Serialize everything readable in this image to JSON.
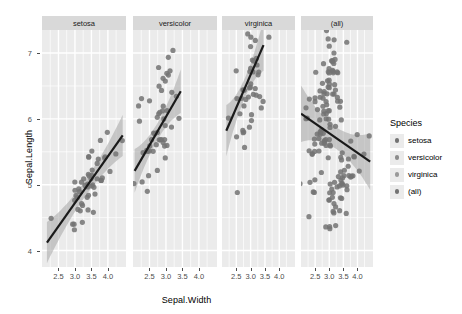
{
  "chart_data": {
    "type": "scatter",
    "title": "",
    "xlabel": "Sepal.Width",
    "ylabel": "Sepal.Length",
    "xlim": [
      2.0,
      4.55
    ],
    "ylim": [
      3.75,
      7.35
    ],
    "xticks": [
      2.5,
      3.0,
      3.5,
      4.0
    ],
    "xtick_labels": [
      "2.5",
      "3.0",
      "3.5",
      "4.0"
    ],
    "yticks": [
      4,
      5,
      6,
      7
    ],
    "ytick_labels": [
      "4",
      "5",
      "6",
      "7"
    ],
    "grid": true,
    "legend_position": "right",
    "legend_title": "Species",
    "facet_labels": [
      "setosa",
      "versicolor",
      "virginica",
      "(all)"
    ],
    "point_color": "#737373",
    "line_color": "#1a1a1a",
    "band_color": "#a6a6a6",
    "panel_background": "#ebebeb",
    "strip_background": "#d9d9d9",
    "grid_color": "#ffffff",
    "series": [
      {
        "name": "setosa",
        "facet": "setosa",
        "fit": {
          "x0": 2.15,
          "y0": 4.12,
          "x1": 4.45,
          "y1": 5.75,
          "se": 0.16
        },
        "x": [
          3.5,
          3.0,
          3.2,
          3.1,
          3.6,
          3.9,
          3.4,
          3.4,
          2.9,
          3.1,
          3.7,
          3.4,
          3.0,
          3.0,
          4.0,
          4.4,
          3.9,
          3.5,
          3.8,
          3.8,
          3.4,
          3.7,
          3.6,
          3.3,
          3.4,
          3.0,
          3.4,
          3.5,
          3.4,
          3.2,
          3.1,
          3.4,
          4.1,
          4.2,
          3.1,
          3.2,
          3.5,
          3.6,
          3.0,
          3.4,
          3.5,
          2.3,
          3.2,
          3.5,
          3.8,
          3.0,
          3.8,
          3.2,
          3.7,
          3.3
        ],
        "y": [
          5.1,
          4.9,
          4.7,
          4.6,
          5.0,
          5.4,
          4.6,
          5.0,
          4.4,
          4.9,
          5.4,
          4.8,
          4.8,
          4.3,
          5.8,
          5.7,
          5.4,
          5.1,
          5.7,
          5.1,
          5.4,
          5.1,
          4.6,
          5.1,
          4.8,
          5.0,
          5.0,
          5.2,
          5.2,
          4.7,
          4.8,
          5.4,
          5.2,
          5.5,
          4.9,
          5.0,
          5.5,
          4.9,
          4.4,
          5.1,
          5.0,
          4.5,
          4.4,
          5.0,
          5.1,
          4.8,
          5.1,
          4.6,
          5.3,
          5.0
        ]
      },
      {
        "name": "versicolor",
        "facet": "versicolor",
        "fit": {
          "x0": 2.05,
          "y0": 5.21,
          "x1": 3.45,
          "y1": 6.42,
          "se": 0.17
        },
        "x": [
          3.2,
          3.2,
          3.1,
          2.3,
          2.8,
          2.8,
          3.3,
          2.4,
          2.9,
          2.7,
          2.0,
          3.0,
          2.2,
          2.9,
          2.9,
          3.1,
          3.0,
          2.7,
          2.2,
          2.5,
          3.2,
          2.8,
          2.5,
          2.8,
          2.9,
          3.0,
          2.8,
          3.0,
          2.9,
          2.6,
          2.4,
          2.4,
          2.7,
          2.7,
          3.0,
          3.4,
          3.1,
          2.3,
          3.0,
          2.5,
          2.6,
          3.0,
          2.6,
          2.3,
          2.7,
          3.0,
          2.9,
          2.9,
          2.5,
          2.8
        ],
        "y": [
          7.0,
          6.4,
          6.9,
          5.5,
          6.5,
          5.7,
          6.3,
          4.9,
          6.6,
          5.2,
          5.0,
          5.9,
          6.0,
          6.1,
          5.6,
          6.7,
          5.6,
          5.8,
          6.2,
          5.6,
          5.9,
          6.1,
          6.3,
          6.1,
          6.4,
          6.6,
          6.8,
          6.7,
          6.0,
          5.7,
          5.5,
          5.5,
          5.8,
          6.0,
          5.4,
          6.0,
          6.7,
          6.3,
          5.6,
          5.5,
          5.5,
          6.1,
          5.8,
          5.0,
          5.6,
          5.7,
          5.7,
          6.2,
          5.1,
          5.7
        ]
      },
      {
        "name": "virginica",
        "facet": "virginica",
        "fit": {
          "x0": 2.15,
          "y0": 5.82,
          "x1": 3.45,
          "y1": 7.12,
          "se": 0.2
        },
        "x": [
          3.3,
          2.7,
          3.0,
          2.9,
          3.0,
          3.0,
          2.5,
          2.9,
          2.5,
          3.6,
          3.2,
          2.7,
          3.0,
          2.5,
          2.8,
          3.2,
          3.0,
          3.8,
          2.6,
          2.2,
          3.2,
          2.8,
          2.8,
          2.7,
          3.3,
          3.2,
          2.8,
          3.0,
          2.8,
          3.0,
          2.8,
          3.8,
          2.8,
          2.8,
          2.6,
          3.0,
          3.4,
          3.1,
          3.0,
          3.1,
          3.1,
          3.1,
          2.7,
          3.2,
          3.3,
          3.0,
          2.5,
          3.0,
          3.4,
          3.0
        ],
        "y": [
          6.3,
          5.8,
          7.1,
          6.3,
          6.5,
          7.6,
          4.9,
          7.3,
          6.7,
          7.2,
          6.5,
          6.4,
          6.8,
          5.7,
          5.8,
          6.4,
          6.5,
          7.7,
          7.7,
          6.0,
          6.9,
          5.6,
          7.7,
          6.3,
          6.7,
          7.2,
          6.2,
          6.1,
          6.4,
          7.2,
          7.4,
          7.9,
          6.4,
          6.3,
          6.1,
          7.7,
          6.3,
          6.4,
          6.0,
          6.9,
          6.7,
          6.9,
          5.8,
          6.8,
          6.7,
          6.7,
          6.3,
          6.5,
          6.2,
          5.9
        ]
      },
      {
        "name": "(all)",
        "facet": "(all)",
        "fit": {
          "x0": 2.0,
          "y0": 6.08,
          "x1": 4.45,
          "y1": 5.35,
          "se": 0.22
        },
        "x": [
          3.5,
          3.0,
          3.2,
          3.1,
          3.6,
          3.9,
          3.4,
          3.4,
          2.9,
          3.1,
          3.7,
          3.4,
          3.0,
          3.0,
          4.0,
          4.4,
          3.9,
          3.5,
          3.8,
          3.8,
          3.4,
          3.7,
          3.6,
          3.3,
          3.4,
          3.0,
          3.4,
          3.5,
          3.4,
          3.2,
          3.1,
          3.4,
          4.1,
          4.2,
          3.1,
          3.2,
          3.5,
          3.6,
          3.0,
          3.4,
          3.5,
          2.3,
          3.2,
          3.5,
          3.8,
          3.0,
          3.8,
          3.2,
          3.7,
          3.3,
          3.2,
          3.2,
          3.1,
          2.3,
          2.8,
          2.8,
          3.3,
          2.4,
          2.9,
          2.7,
          2.0,
          3.0,
          2.2,
          2.9,
          2.9,
          3.1,
          3.0,
          2.7,
          2.2,
          2.5,
          3.2,
          2.8,
          2.5,
          2.8,
          2.9,
          3.0,
          2.8,
          3.0,
          2.9,
          2.6,
          2.4,
          2.4,
          2.7,
          2.7,
          3.0,
          3.4,
          3.1,
          2.3,
          3.0,
          2.5,
          2.6,
          3.0,
          2.6,
          2.3,
          2.7,
          3.0,
          2.9,
          2.9,
          2.5,
          2.8,
          3.3,
          2.7,
          3.0,
          2.9,
          3.0,
          3.0,
          2.5,
          2.9,
          2.5,
          3.6,
          3.2,
          2.7,
          3.0,
          2.5,
          2.8,
          3.2,
          3.0,
          3.8,
          2.6,
          2.2,
          3.2,
          2.8,
          2.8,
          2.7,
          3.3,
          3.2,
          2.8,
          3.0,
          2.8,
          3.0,
          2.8,
          3.8,
          2.8,
          2.8,
          2.6,
          3.0,
          3.4,
          3.1,
          3.0,
          3.1,
          3.1,
          3.1,
          2.7,
          3.2,
          3.3,
          3.0,
          2.5,
          3.0,
          3.4,
          3.0
        ],
        "y": [
          5.1,
          4.9,
          4.7,
          4.6,
          5.0,
          5.4,
          4.6,
          5.0,
          4.4,
          4.9,
          5.4,
          4.8,
          4.8,
          4.3,
          5.8,
          5.7,
          5.4,
          5.1,
          5.7,
          5.1,
          5.4,
          5.1,
          4.6,
          5.1,
          4.8,
          5.0,
          5.0,
          5.2,
          5.2,
          4.7,
          4.8,
          5.4,
          5.2,
          5.5,
          4.9,
          5.0,
          5.5,
          4.9,
          4.4,
          5.1,
          5.0,
          4.5,
          4.4,
          5.0,
          5.1,
          4.8,
          5.1,
          4.6,
          5.3,
          5.0,
          7.0,
          6.4,
          6.9,
          5.5,
          6.5,
          5.7,
          6.3,
          4.9,
          6.6,
          5.2,
          5.0,
          5.9,
          6.0,
          6.1,
          5.6,
          6.7,
          5.6,
          5.8,
          6.2,
          5.6,
          5.9,
          6.1,
          6.3,
          6.1,
          6.4,
          6.6,
          6.8,
          6.7,
          6.0,
          5.7,
          5.5,
          5.5,
          5.8,
          6.0,
          5.4,
          6.0,
          6.7,
          6.3,
          5.6,
          5.5,
          5.5,
          6.1,
          5.8,
          5.0,
          5.6,
          5.7,
          5.7,
          6.2,
          5.1,
          5.7,
          6.3,
          5.8,
          7.1,
          6.3,
          6.5,
          7.6,
          4.9,
          7.3,
          6.7,
          7.2,
          6.5,
          6.4,
          6.8,
          5.7,
          5.8,
          6.4,
          6.5,
          7.7,
          7.7,
          6.0,
          6.9,
          5.6,
          7.7,
          6.3,
          6.7,
          7.2,
          6.2,
          6.1,
          6.4,
          7.2,
          7.4,
          7.9,
          6.4,
          6.3,
          6.1,
          7.7,
          6.3,
          6.4,
          6.0,
          6.9,
          6.7,
          6.9,
          5.8,
          6.8,
          6.7,
          6.7,
          6.3,
          6.5,
          6.2,
          5.9
        ]
      }
    ]
  },
  "legend": {
    "title": "Species",
    "items": [
      {
        "label": "setosa",
        "color": "#737373"
      },
      {
        "label": "versicolor",
        "color": "#8c8c8c"
      },
      {
        "label": "virginica",
        "color": "#999999"
      },
      {
        "label": "(all)",
        "color": "#737373"
      }
    ]
  },
  "axes": {
    "y_title": "Sepal.Length",
    "x_title": "Sepal.Width",
    "y_ticks": [
      "4",
      "5",
      "6",
      "7"
    ],
    "x_ticks": [
      "2.5",
      "3.0",
      "3.5",
      "4.0"
    ]
  },
  "facets": [
    {
      "label": "setosa"
    },
    {
      "label": "versicolor"
    },
    {
      "label": "virginica"
    },
    {
      "label": "(all)"
    }
  ]
}
